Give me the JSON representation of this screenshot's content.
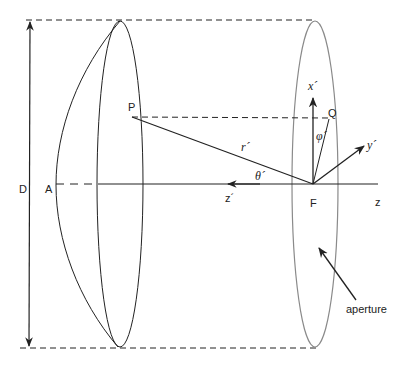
{
  "diagram": {
    "type": "paraboloid reflector antenna geometry",
    "labels": {
      "D": "D",
      "A": "A",
      "P": "P",
      "Q": "Q",
      "F": "F",
      "r_prime": "r´",
      "theta_prime": "θ´",
      "phi_prime": "φ´",
      "x_prime": "x´",
      "y_prime": "y´",
      "z_prime": "z´",
      "z": "z",
      "aperture": "aperture"
    },
    "colors": {
      "stroke": "#222222",
      "aperture_stroke": "#8a8a8a",
      "background": "#ffffff"
    }
  }
}
